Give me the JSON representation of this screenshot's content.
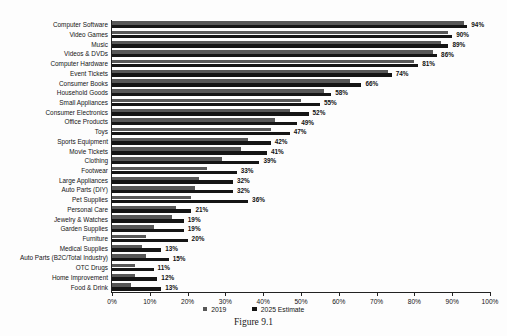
{
  "caption": "Figure 9.1",
  "chart_data": {
    "type": "bar",
    "orientation": "horizontal",
    "title": "",
    "xlabel": "",
    "ylabel": "",
    "xlim": [
      0,
      100
    ],
    "x_tick_step": 10,
    "x_tick_labels": [
      "0%",
      "10%",
      "20%",
      "30%",
      "40%",
      "50%",
      "60%",
      "70%",
      "80%",
      "90%",
      "100%"
    ],
    "grid": false,
    "legend_position": "bottom",
    "categories": [
      "Computer Software",
      "Video Games",
      "Music",
      "Videos & DVDs",
      "Computer Hardware",
      "Event Tickets",
      "Consumer Books",
      "Household Goods",
      "Small Appliances",
      "Consumer Electronics",
      "Office Products",
      "Toys",
      "Sports Equipment",
      "Movie Tickets",
      "Clothing",
      "Footwear",
      "Large Appliances",
      "Auto Parts (DIY)",
      "Pet Supplies",
      "Personal Care",
      "Jewelry & Watches",
      "Garden Supplies",
      "Furniture",
      "Medical Supplies",
      "Auto Parts (B2C/Total Industry)",
      "OTC Drugs",
      "Home Improvement",
      "Food & Drink"
    ],
    "series": [
      {
        "name": "2019",
        "color": "#575757",
        "values": [
          93,
          89,
          87,
          85,
          80,
          73,
          63,
          56,
          50,
          47,
          43,
          42,
          36,
          34,
          29,
          25,
          23,
          22,
          21,
          17,
          16,
          11,
          9,
          8,
          9,
          6,
          6,
          5
        ]
      },
      {
        "name": "2025 Estimate",
        "color": "#151515",
        "values": [
          94,
          90,
          89,
          86,
          81,
          74,
          66,
          58,
          55,
          52,
          49,
          47,
          42,
          41,
          39,
          33,
          32,
          32,
          36,
          21,
          19,
          19,
          20,
          13,
          15,
          11,
          12,
          13
        ],
        "data_labels": [
          "94%",
          "90%",
          "89%",
          "86%",
          "81%",
          "74%",
          "66%",
          "58%",
          "55%",
          "52%",
          "49%",
          "47%",
          "42%",
          "41%",
          "39%",
          "33%",
          "32%",
          "32%",
          "36%",
          "21%",
          "19%",
          "19%",
          "20%",
          "13%",
          "15%",
          "11%",
          "12%",
          "13%"
        ]
      }
    ]
  }
}
